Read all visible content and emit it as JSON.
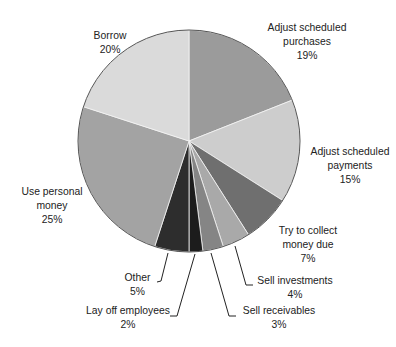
{
  "chart_data": {
    "type": "pie",
    "title": "",
    "start_angle_deg": 0,
    "direction": "clockwise",
    "slices": [
      {
        "label": "Adjust scheduled purchases",
        "value": 19,
        "color": "#9b9b9b"
      },
      {
        "label": "Adjust scheduled payments",
        "value": 15,
        "color": "#cdcdcd"
      },
      {
        "label": "Try to collect money due",
        "value": 7,
        "color": "#6f6f6f"
      },
      {
        "label": "Sell investments",
        "value": 4,
        "color": "#a9a9a9"
      },
      {
        "label": "Sell receivables",
        "value": 3,
        "color": "#858585"
      },
      {
        "label": "Lay off employees",
        "value": 2,
        "color": "#1c1c1c"
      },
      {
        "label": "Other",
        "value": 5,
        "color": "#2d2d2d"
      },
      {
        "label": "Use personal money",
        "value": 25,
        "color": "#a3a3a3"
      },
      {
        "label": "Borrow",
        "value": 20,
        "color": "#dadada"
      }
    ]
  },
  "labels": {
    "purchases": {
      "line1": "Adjust scheduled",
      "line2": "purchases",
      "pct": "19%"
    },
    "payments": {
      "line1": "Adjust scheduled",
      "line2": "payments",
      "pct": "15%"
    },
    "collect": {
      "line1": "Try to collect",
      "line2": "money due",
      "pct": "7%"
    },
    "investments": {
      "line1": "Sell investments",
      "pct": "4%"
    },
    "receivables": {
      "line1": "Sell receivables",
      "pct": "3%"
    },
    "layoff": {
      "line1": "Lay off employees",
      "pct": "2%"
    },
    "other": {
      "line1": "Other",
      "pct": "5%"
    },
    "personal": {
      "line1": "Use personal",
      "line2": "money",
      "pct": "25%"
    },
    "borrow": {
      "line1": "Borrow",
      "pct": "20%"
    }
  }
}
